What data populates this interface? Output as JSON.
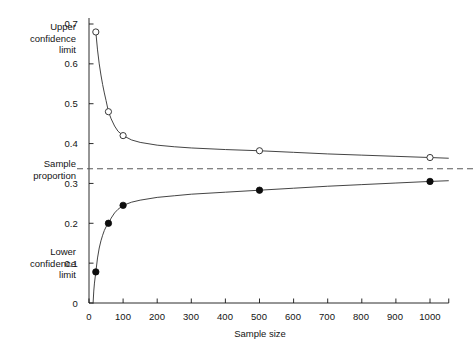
{
  "chart_data": {
    "type": "line",
    "title": "",
    "xlabel": "Sample size",
    "ylabel": "",
    "xlim": [
      0,
      1055
    ],
    "ylim": [
      0,
      0.7
    ],
    "grid": false,
    "legend_position": "none",
    "x_ticks": [
      0,
      100,
      200,
      300,
      400,
      500,
      600,
      700,
      800,
      900,
      1000
    ],
    "x_tick_labels": [
      "0",
      "100",
      "200",
      "300",
      "400",
      "500",
      "600",
      "700",
      "800",
      "900",
      "1000"
    ],
    "y_ticks": [
      0,
      0.1,
      0.2,
      0.3,
      0.4,
      0.5,
      0.6,
      0.7
    ],
    "y_tick_labels": [
      "0",
      "0.1",
      "0.2",
      "0.3",
      "0.4",
      "0.5",
      "0.6",
      "0.7"
    ],
    "x": [
      20,
      57,
      100,
      500,
      1000
    ],
    "series": [
      {
        "name": "Upper confidence limit",
        "marker": "open-circle",
        "values": [
          0.68,
          0.48,
          0.42,
          0.382,
          0.365
        ],
        "curve": [
          [
            20,
            0.68
          ],
          [
            25,
            0.635
          ],
          [
            30,
            0.6
          ],
          [
            35,
            0.572
          ],
          [
            40,
            0.548
          ],
          [
            45,
            0.527
          ],
          [
            50,
            0.508
          ],
          [
            57,
            0.48
          ],
          [
            65,
            0.462
          ],
          [
            75,
            0.444
          ],
          [
            85,
            0.431
          ],
          [
            100,
            0.42
          ],
          [
            125,
            0.409
          ],
          [
            150,
            0.403
          ],
          [
            200,
            0.396
          ],
          [
            250,
            0.392
          ],
          [
            300,
            0.389
          ],
          [
            400,
            0.385
          ],
          [
            500,
            0.382
          ],
          [
            600,
            0.378
          ],
          [
            700,
            0.374
          ],
          [
            800,
            0.371
          ],
          [
            900,
            0.368
          ],
          [
            1000,
            0.365
          ]
        ]
      },
      {
        "name": "Lower confidence limit",
        "marker": "filled-circle",
        "values": [
          0.078,
          0.2,
          0.245,
          0.283,
          0.305
        ],
        "curve": [
          [
            12,
            0.0
          ],
          [
            14,
            0.03
          ],
          [
            16,
            0.05
          ],
          [
            20,
            0.078
          ],
          [
            25,
            0.113
          ],
          [
            30,
            0.138
          ],
          [
            35,
            0.156
          ],
          [
            40,
            0.17
          ],
          [
            45,
            0.182
          ],
          [
            50,
            0.191
          ],
          [
            57,
            0.2
          ],
          [
            65,
            0.213
          ],
          [
            75,
            0.226
          ],
          [
            85,
            0.235
          ],
          [
            100,
            0.245
          ],
          [
            125,
            0.253
          ],
          [
            150,
            0.258
          ],
          [
            200,
            0.265
          ],
          [
            250,
            0.269
          ],
          [
            300,
            0.273
          ],
          [
            400,
            0.278
          ],
          [
            500,
            0.283
          ],
          [
            600,
            0.288
          ],
          [
            700,
            0.293
          ],
          [
            800,
            0.297
          ],
          [
            900,
            0.301
          ],
          [
            1000,
            0.305
          ]
        ]
      }
    ],
    "reference_line": {
      "name": "Sample proportion",
      "value": 0.337,
      "style": "dashed",
      "orientation": "horizontal"
    },
    "annotations": [
      {
        "name": "upper-confidence-limit",
        "text": "Upper\nconfidence\nlimit",
        "at_y": 0.62
      },
      {
        "name": "sample-proportion",
        "text": "Sample\nproportion",
        "at_y": 0.337
      },
      {
        "name": "lower-confidence-limit",
        "text": "Lower\nconfidence\nlimit",
        "at_y": 0.1
      }
    ]
  },
  "labels": {
    "upper_confidence_limit": "Upper\nconfidence\nlimit",
    "upper_line1": "Upper",
    "upper_line2": "confidence",
    "upper_line3": "limit",
    "sample_proportion_line1": "Sample",
    "sample_proportion_line2": "proportion",
    "lower_line1": "Lower",
    "lower_line2": "confidence",
    "lower_line3": "limit",
    "x_axis_title": "Sample size"
  },
  "y_axis": {
    "t0": "0",
    "t1": "0.1",
    "t2": "0.2",
    "t3": "0.3",
    "t4": "0.4",
    "t5": "0.5",
    "t6": "0.6",
    "t7": "0.7"
  },
  "x_axis": {
    "t0": "0",
    "t1": "100",
    "t2": "200",
    "t3": "300",
    "t4": "400",
    "t5": "500",
    "t6": "600",
    "t7": "700",
    "t8": "800",
    "t9": "900",
    "t10": "1000"
  },
  "colors": {
    "ink": "#141414",
    "curve": "#3a3a3a",
    "dashed": "#5a5a5a",
    "background": "#ffffff"
  }
}
